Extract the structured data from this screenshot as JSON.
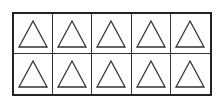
{
  "diagram": {
    "type": "ten-frame",
    "rows": 2,
    "columns": 5,
    "shape": "triangle-outline",
    "stroke_color": "#333333",
    "border_color": "#222222",
    "cells": [
      {
        "row": 1,
        "col": 1,
        "shape": "triangle"
      },
      {
        "row": 1,
        "col": 2,
        "shape": "triangle"
      },
      {
        "row": 1,
        "col": 3,
        "shape": "triangle"
      },
      {
        "row": 1,
        "col": 4,
        "shape": "triangle"
      },
      {
        "row": 1,
        "col": 5,
        "shape": "triangle"
      },
      {
        "row": 2,
        "col": 1,
        "shape": "triangle"
      },
      {
        "row": 2,
        "col": 2,
        "shape": "triangle"
      },
      {
        "row": 2,
        "col": 3,
        "shape": "triangle"
      },
      {
        "row": 2,
        "col": 4,
        "shape": "triangle"
      },
      {
        "row": 2,
        "col": 5,
        "shape": "triangle"
      }
    ],
    "count": 10
  }
}
